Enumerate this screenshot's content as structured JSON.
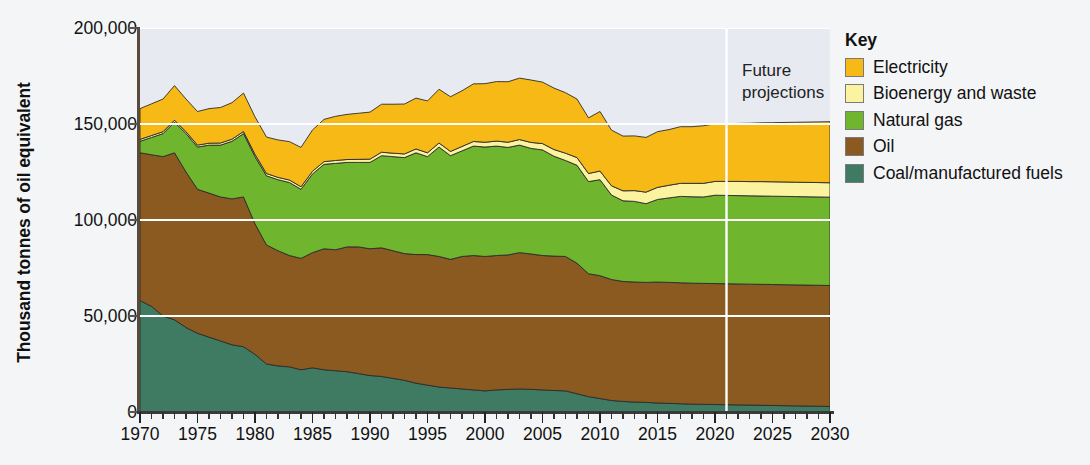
{
  "chart_data": {
    "type": "area",
    "stacked": true,
    "title": "",
    "xlabel": "",
    "ylabel": "Thousand tonnes of oil equivalent",
    "xlim": [
      1970,
      2030
    ],
    "ylim": [
      0,
      200000
    ],
    "yticks": [
      0,
      50000,
      100000,
      150000,
      200000
    ],
    "ytick_labels": [
      "0",
      "50,000",
      "100,000",
      "150,000",
      "200,000"
    ],
    "xticks": [
      1970,
      1975,
      1980,
      1985,
      1990,
      1995,
      2000,
      2005,
      2010,
      2015,
      2020,
      2025,
      2030
    ],
    "xtick_labels": [
      "1970",
      "1975",
      "1980",
      "1985",
      "1990",
      "1995",
      "2000",
      "2005",
      "2010",
      "2015",
      "2020",
      "2025",
      "2030"
    ],
    "x_minor_tick_step": 1,
    "grid": "horizontal-white",
    "legend_position": "right",
    "legend_title": "Key",
    "annotation": {
      "text_line1": "Future",
      "text_line2": "projections",
      "divider_year": 2021
    },
    "x": [
      1970,
      1971,
      1972,
      1973,
      1974,
      1975,
      1976,
      1977,
      1978,
      1979,
      1980,
      1981,
      1982,
      1983,
      1984,
      1985,
      1986,
      1987,
      1988,
      1989,
      1990,
      1991,
      1992,
      1993,
      1994,
      1995,
      1996,
      1997,
      1998,
      1999,
      2000,
      2001,
      2002,
      2003,
      2004,
      2005,
      2006,
      2007,
      2008,
      2009,
      2010,
      2011,
      2012,
      2013,
      2014,
      2015,
      2016,
      2017,
      2018,
      2019,
      2020,
      2021,
      2022,
      2023,
      2024,
      2025,
      2026,
      2027,
      2028,
      2029,
      2030
    ],
    "series": [
      {
        "name": "Coal/manufactured fuels",
        "color": "#3f7a63",
        "values": [
          58000,
          55000,
          50000,
          48000,
          44000,
          41000,
          39000,
          37000,
          35000,
          34000,
          30000,
          25000,
          24000,
          23500,
          22000,
          23000,
          22000,
          21500,
          21000,
          20000,
          19000,
          18500,
          17500,
          16500,
          15000,
          14000,
          13000,
          12500,
          12000,
          11500,
          11000,
          11500,
          11800,
          12000,
          11800,
          11500,
          11200,
          11000,
          9500,
          8000,
          7000,
          6000,
          5500,
          5200,
          5000,
          4700,
          4500,
          4300,
          4100,
          4000,
          3900,
          3800,
          3700,
          3600,
          3500,
          3400,
          3300,
          3200,
          3100,
          3000,
          2900
        ]
      },
      {
        "name": "Oil",
        "color": "#8a5a20",
        "values": [
          77000,
          79000,
          83000,
          87000,
          81000,
          75000,
          75000,
          75000,
          76000,
          78000,
          68000,
          62000,
          60000,
          58000,
          58000,
          60000,
          63000,
          63000,
          65000,
          66000,
          66000,
          67000,
          66500,
          66000,
          67000,
          68000,
          68000,
          67000,
          69000,
          70000,
          70000,
          70000,
          70000,
          71000,
          70500,
          70000,
          70000,
          70000,
          68000,
          64000,
          64000,
          63000,
          62500,
          62500,
          62500,
          63000,
          63000,
          63000,
          63000,
          63000,
          63000,
          63000,
          63000,
          63000,
          63000,
          63000,
          63000,
          63000,
          63000,
          63000,
          63000
        ]
      },
      {
        "name": "Natural gas",
        "color": "#6fb52e",
        "values": [
          6000,
          9000,
          12000,
          16000,
          20000,
          22000,
          25000,
          27000,
          30000,
          33000,
          35000,
          36000,
          37000,
          38000,
          36000,
          41000,
          44000,
          45000,
          44000,
          44000,
          45000,
          48000,
          49000,
          50000,
          53000,
          51000,
          57000,
          54000,
          55000,
          57000,
          57000,
          57000,
          56000,
          56000,
          55000,
          55000,
          52000,
          50000,
          51000,
          48000,
          50000,
          44000,
          42000,
          42000,
          41000,
          43000,
          44000,
          45000,
          45000,
          45000,
          46000,
          46000,
          46000,
          46000,
          46000,
          46000,
          46000,
          46000,
          46000,
          46000,
          46000
        ]
      },
      {
        "name": "Bioenergy and waste",
        "color": "#fbf3a0",
        "values": [
          1000,
          1000,
          1000,
          1000,
          1000,
          1000,
          1000,
          1100,
          1100,
          1100,
          1200,
          1200,
          1200,
          1300,
          1300,
          1400,
          1400,
          1500,
          1500,
          1600,
          1700,
          1800,
          1800,
          1900,
          2000,
          2000,
          2100,
          2200,
          2300,
          2400,
          2500,
          2600,
          2700,
          2900,
          3100,
          3300,
          3500,
          3800,
          4000,
          4200,
          4500,
          4800,
          5200,
          5600,
          6000,
          6300,
          6600,
          6800,
          7000,
          7100,
          7200,
          7300,
          7400,
          7400,
          7500,
          7500,
          7500,
          7500,
          7500,
          7500,
          7500
        ]
      },
      {
        "name": "Electricity",
        "color": "#f6b916",
        "values": [
          16000,
          16500,
          17000,
          18000,
          17000,
          17500,
          18000,
          18500,
          19000,
          20000,
          19500,
          19000,
          19500,
          20000,
          20500,
          21500,
          22000,
          23000,
          23500,
          24000,
          24500,
          25000,
          25500,
          26000,
          26500,
          27000,
          28000,
          28500,
          29000,
          30000,
          30500,
          31000,
          31500,
          32000,
          32500,
          32000,
          32000,
          31500,
          30500,
          29000,
          31000,
          29000,
          28500,
          28500,
          28500,
          29000,
          29000,
          29500,
          29500,
          30000,
          30000,
          30000,
          30200,
          30400,
          30600,
          30800,
          31000,
          31200,
          31400,
          31600,
          31800
        ]
      }
    ]
  }
}
